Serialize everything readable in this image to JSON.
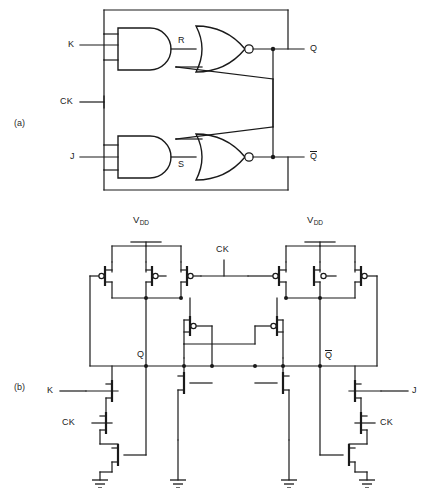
{
  "figure": {
    "type": "circuit-schematic",
    "panels": [
      {
        "tag": "(a)",
        "name": "gate-level-jk-flipflop",
        "inputs": [
          "K",
          "CK",
          "J"
        ],
        "internal_nodes": [
          "R",
          "S"
        ],
        "outputs": [
          "Q",
          "Q̄"
        ],
        "gates": [
          {
            "id": "and-top",
            "type": "AND",
            "inputs": 3,
            "output_label": "R"
          },
          {
            "id": "and-bottom",
            "type": "AND",
            "inputs": 3,
            "output_label": "S"
          },
          {
            "id": "nor-top",
            "type": "NOR",
            "inputs": 2,
            "output_label": "Q"
          },
          {
            "id": "nor-bottom",
            "type": "NOR",
            "inputs": 2,
            "output_label": "Q̄"
          }
        ]
      },
      {
        "tag": "(b)",
        "name": "cmos-jk-flipflop",
        "supply_label": "V",
        "supply_sub": "DD",
        "inputs": [
          "K",
          "CK",
          "J"
        ],
        "outputs": [
          "Q",
          "Q̄"
        ],
        "clock_label": "CK",
        "supply_rails": 2,
        "ground_symbols": 4,
        "pmos_count": 8,
        "nmos_count": 10
      }
    ],
    "labels": {
      "K": "K",
      "J": "J",
      "CK": "CK",
      "R": "R",
      "S": "S",
      "Q": "Q",
      "Qbar": "Q",
      "vdd": "V",
      "vdd_sub": "DD",
      "tag_a": "(a)",
      "tag_b": "(b)"
    },
    "colors": {
      "background": "#ffffff",
      "wire": "#1a1a1a",
      "text": "#1a1a1a"
    }
  }
}
